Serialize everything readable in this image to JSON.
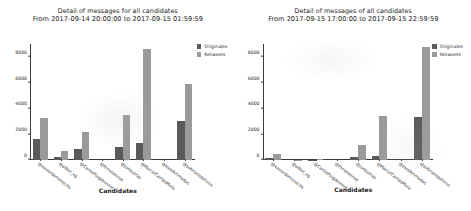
{
  "chart_data": [
    {
      "type": "bar",
      "title": "Detail of messages for all candidates",
      "subtitle": "From 2017-09-14 20:00:00 to 2017-09-15 01:59:59",
      "xlabel": "Candidates",
      "ylabel": "",
      "ylim": [
        0,
        9000
      ],
      "yticks": [
        0,
        2000,
        4000,
        6000,
        8000
      ],
      "ytick_labels": [
        "0",
        "2000",
        "4000",
        "6000",
        "8000"
      ],
      "grid": false,
      "legend_position": "upper right",
      "categories": [
        "@xavierdomenechs",
        "@albiol_xg",
        "@CarlesPuigdemont",
        "@ferranserrat",
        "@junqueras",
        "@MarcelCampsMora",
        "@InesArrimadas",
        "@sobiranistaforca"
      ],
      "series": [
        {
          "name": "Originales",
          "color": "#5a5a5a",
          "values": [
            1620,
            260,
            880,
            0,
            1010,
            1340,
            0,
            3010
          ]
        },
        {
          "name": "Retweets",
          "color": "#9a9a9a",
          "values": [
            3260,
            720,
            2200,
            0,
            3470,
            8600,
            0,
            5900
          ]
        }
      ]
    },
    {
      "type": "bar",
      "title": "Detail of messages of all candidates",
      "subtitle": "From 2017-09-15 17:00:00 to 2017-09-15 22:59:59",
      "xlabel": "Candidates",
      "ylabel": "",
      "ylim": [
        0,
        9000
      ],
      "yticks": [
        0,
        2000,
        4000,
        6000,
        8000
      ],
      "ytick_labels": [
        "0",
        "2000",
        "4000",
        "6000",
        "8000"
      ],
      "grid": false,
      "legend_position": "upper right",
      "categories": [
        "@xavierdomenechs",
        "@albiol_xg",
        "@CarlesPuigdemont",
        "@ferranserrat",
        "@junqueras",
        "@MarcelCampsMora",
        "@InesArrimadas",
        "@sobiranistaforca"
      ],
      "series": [
        {
          "name": "Originales",
          "color": "#5a5a5a",
          "values": [
            190,
            0,
            30,
            0,
            230,
            330,
            0,
            3350
          ]
        },
        {
          "name": "Retweets",
          "color": "#9a9a9a",
          "values": [
            450,
            20,
            110,
            0,
            1200,
            3450,
            0,
            8800
          ]
        }
      ]
    }
  ],
  "legend": {
    "originales_label": "Originales",
    "retweets_label": "Retweets"
  }
}
